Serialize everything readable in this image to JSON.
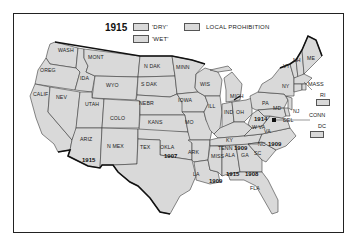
{
  "map": {
    "year": "1915",
    "legend": [
      {
        "key": "dry",
        "label": "'DRY'"
      },
      {
        "key": "wet",
        "label": "'WET'"
      },
      {
        "key": "local",
        "label": "LOCAL PROHIBITION"
      }
    ],
    "fill_color": "#d9d9d9",
    "border_color": "#222222",
    "states": [
      {
        "abbr": "WASH"
      },
      {
        "abbr": "OREG"
      },
      {
        "abbr": "CALIF"
      },
      {
        "abbr": "IDA"
      },
      {
        "abbr": "NEV"
      },
      {
        "abbr": "MONT"
      },
      {
        "abbr": "WYO"
      },
      {
        "abbr": "UTAH"
      },
      {
        "abbr": "ARIZ",
        "prohibition_year": "1915"
      },
      {
        "abbr": "COLO"
      },
      {
        "abbr": "N MEX"
      },
      {
        "abbr": "N DAK"
      },
      {
        "abbr": "S DAK"
      },
      {
        "abbr": "NEBR"
      },
      {
        "abbr": "KANS"
      },
      {
        "abbr": "TEX"
      },
      {
        "abbr": "OKLA",
        "prohibition_year": "1907"
      },
      {
        "abbr": "MINN"
      },
      {
        "abbr": "IOWA"
      },
      {
        "abbr": "MO"
      },
      {
        "abbr": "ARK"
      },
      {
        "abbr": "LA"
      },
      {
        "abbr": "WIS"
      },
      {
        "abbr": "ILL"
      },
      {
        "abbr": "MICH"
      },
      {
        "abbr": "IND"
      },
      {
        "abbr": "OH"
      },
      {
        "abbr": "KY"
      },
      {
        "abbr": "TENN",
        "prohibition_year": "1909"
      },
      {
        "abbr": "MISS",
        "prohibition_year": "1909"
      },
      {
        "abbr": "ALA",
        "prohibition_year": "1915"
      },
      {
        "abbr": "GA",
        "prohibition_year": "1908"
      },
      {
        "abbr": "FLA"
      },
      {
        "abbr": "SC"
      },
      {
        "abbr": "NC",
        "prohibition_year": "1909"
      },
      {
        "abbr": "VA"
      },
      {
        "abbr": "W VA",
        "prohibition_year": "1914"
      },
      {
        "abbr": "PA"
      },
      {
        "abbr": "MD"
      },
      {
        "abbr": "DEL"
      },
      {
        "abbr": "NJ"
      },
      {
        "abbr": "NY"
      },
      {
        "abbr": "VT"
      },
      {
        "abbr": "NH"
      },
      {
        "abbr": "ME"
      },
      {
        "abbr": "MASS"
      },
      {
        "abbr": "RI"
      },
      {
        "abbr": "CONN"
      },
      {
        "abbr": "DC"
      }
    ],
    "callouts": [
      {
        "abbr": "MASS"
      },
      {
        "abbr": "RI"
      },
      {
        "abbr": "CONN"
      },
      {
        "abbr": "DC"
      }
    ]
  }
}
